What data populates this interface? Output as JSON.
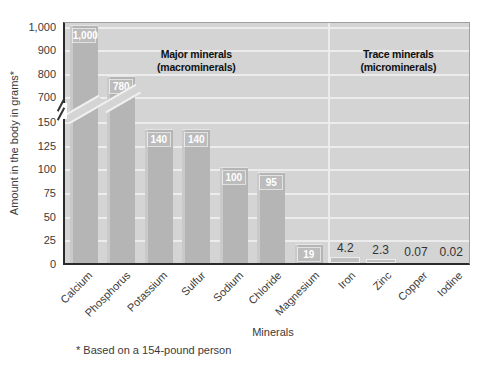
{
  "chart_data": {
    "type": "bar",
    "title": "",
    "ylabel": "Amount in the body in grams*",
    "xlabel": "Minerals",
    "footnote": "* Based on a 154-pound person",
    "grid": true,
    "y_axis": {
      "broken_axis": true,
      "break_between": [
        150,
        700
      ],
      "ticks": [
        {
          "label": "1,000",
          "value": 1000
        },
        {
          "label": "900",
          "value": 900
        },
        {
          "label": "800",
          "value": 800
        },
        {
          "label": "700",
          "value": 700
        },
        {
          "label": "150",
          "value": 150
        },
        {
          "label": "125",
          "value": 125
        },
        {
          "label": "100",
          "value": 100
        },
        {
          "label": "75",
          "value": 75
        },
        {
          "label": "50",
          "value": 50
        },
        {
          "label": "25",
          "value": 25
        },
        {
          "label": "0",
          "value": 0
        }
      ]
    },
    "categories": [
      "Calcium",
      "Phosphorus",
      "Potassium",
      "Sulfur",
      "Sodium",
      "Chloride",
      "Magnesium",
      "Iron",
      "Zinc",
      "Copper",
      "Iodine"
    ],
    "values": [
      1000,
      780,
      140,
      140,
      100,
      95,
      19,
      4.2,
      2.3,
      0.07,
      0.02
    ],
    "sections": [
      {
        "id": "major",
        "title_line1": "Major minerals",
        "title_line2": "(macrominerals)",
        "width_pct": 65,
        "title_center_pct": 32.5,
        "bars": [
          {
            "name": "Calcium",
            "value": 1000,
            "label": "1,000",
            "label_position": "inside",
            "axis_break": true
          },
          {
            "name": "Phosphorus",
            "value": 780,
            "label": "780",
            "label_position": "inside",
            "axis_break": true
          },
          {
            "name": "Potassium",
            "value": 140,
            "label": "140",
            "label_position": "inside",
            "axis_break": false
          },
          {
            "name": "Sulfur",
            "value": 140,
            "label": "140",
            "label_position": "inside",
            "axis_break": false
          },
          {
            "name": "Sodium",
            "value": 100,
            "label": "100",
            "label_position": "inside",
            "axis_break": false
          },
          {
            "name": "Chloride",
            "value": 95,
            "label": "95",
            "label_position": "inside",
            "axis_break": false
          },
          {
            "name": "Magnesium",
            "value": 19,
            "label": "19",
            "label_position": "inside",
            "axis_break": false
          }
        ]
      },
      {
        "id": "trace",
        "title_line1": "Trace minerals",
        "title_line2": "(microminerals)",
        "width_pct": 35,
        "title_center_pct": 82.5,
        "bars": [
          {
            "name": "Iron",
            "value": 4.2,
            "label": "4.2",
            "label_position": "above",
            "axis_break": false
          },
          {
            "name": "Zinc",
            "value": 2.3,
            "label": "2.3",
            "label_position": "above",
            "axis_break": false
          },
          {
            "name": "Copper",
            "value": 0.07,
            "label": "0.07",
            "label_position": "above",
            "axis_break": false
          },
          {
            "name": "Iodine",
            "value": 0.02,
            "label": "0.02",
            "label_position": "above",
            "axis_break": false
          }
        ]
      }
    ]
  },
  "colors": {
    "plot_bg": "#d4d4d4",
    "bar": "#b5b5b5",
    "gridline": "#ececec",
    "axis_dark": "#2b2b2b",
    "border_gray": "#a0a0a0",
    "label_on_bar": "#ffffff",
    "text": "#3a3a3a",
    "title": "#111111"
  }
}
